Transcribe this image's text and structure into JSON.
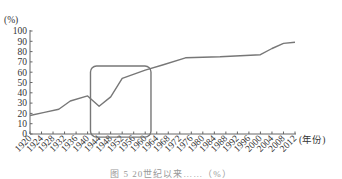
{
  "chart_data": {
    "type": "line",
    "title": "",
    "ylabel": "(%)",
    "xlabel": "(年份)",
    "ylim": [
      0,
      100
    ],
    "yticks": [
      0,
      10,
      20,
      30,
      40,
      50,
      60,
      70,
      80,
      90,
      100
    ],
    "xticks": [
      1920,
      1924,
      1928,
      1932,
      1936,
      1940,
      1944,
      1948,
      1952,
      1956,
      1960,
      1964,
      1968,
      1972,
      1976,
      1980,
      1984,
      1988,
      1992,
      1996,
      2000,
      2004,
      2008,
      2012
    ],
    "grid": false,
    "legend": null,
    "series": [
      {
        "name": "percentage",
        "x": [
          1920,
          1925,
          1930,
          1934,
          1940,
          1944,
          1948,
          1952,
          1960,
          1966,
          1974,
          1986,
          2000,
          2004,
          2008,
          2012
        ],
        "values": [
          18,
          21,
          24,
          32,
          37,
          27,
          36,
          54,
          62,
          67,
          74,
          75,
          77,
          83,
          88,
          89
        ]
      }
    ],
    "annotations": [
      {
        "type": "rounded-rect-highlight",
        "x_range": [
          1941,
          1962
        ],
        "y_range": [
          -3,
          66
        ]
      }
    ]
  },
  "caption": "图 5  20世纪以来……（%）"
}
